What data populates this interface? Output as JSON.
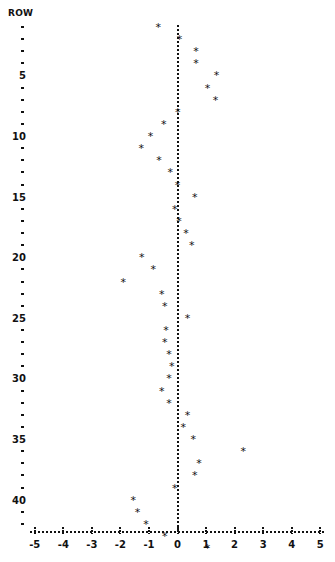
{
  "chart_data": {
    "type": "scatter",
    "title": "",
    "ylabel": "ROW",
    "xlabel": "",
    "xlim": [
      -5,
      5
    ],
    "ylim": [
      0,
      45
    ],
    "grid": false,
    "legend": null,
    "reference_line_x": 0,
    "x_ticks": [
      -5,
      -4,
      -3,
      -2,
      -1,
      0,
      1,
      2,
      3,
      4,
      5
    ],
    "x_tick_labels": [
      "-5",
      "-4",
      "-3",
      "-2",
      "-1",
      "0",
      "1",
      "2",
      "3",
      "4",
      "5"
    ],
    "y_ticks": [
      1,
      2,
      3,
      4,
      5,
      6,
      7,
      8,
      9,
      10,
      11,
      12,
      13,
      14,
      15,
      16,
      17,
      18,
      19,
      20,
      21,
      22,
      23,
      24,
      25,
      26,
      27,
      28,
      29,
      30,
      31,
      32,
      33,
      34,
      35,
      36,
      37,
      38,
      39,
      40,
      41,
      42
    ],
    "y_tick_labels": {
      "5": "5",
      "10": "10",
      "15": "15",
      "20": "20",
      "25": "25",
      "30": "30",
      "35": "35",
      "40": "40"
    },
    "marker": "*",
    "series": [
      {
        "name": "values",
        "rows": [
          1,
          2,
          3,
          4,
          5,
          6,
          7,
          8,
          9,
          10,
          11,
          12,
          13,
          14,
          15,
          16,
          17,
          18,
          19,
          20,
          21,
          22,
          23,
          24,
          25,
          26,
          27,
          28,
          29,
          30,
          31,
          32,
          33,
          34,
          35,
          36,
          37,
          38,
          39,
          40,
          41,
          42,
          43,
          44
        ],
        "values": [
          -0.67,
          0.07,
          0.65,
          0.65,
          1.37,
          1.05,
          1.33,
          0.01,
          -0.48,
          -0.95,
          -1.27,
          -0.65,
          -0.25,
          0.0,
          0.6,
          -0.1,
          0.05,
          0.3,
          0.5,
          -1.25,
          -0.85,
          -1.9,
          -0.55,
          -0.45,
          0.35,
          -0.4,
          -0.45,
          -0.3,
          -0.2,
          -0.3,
          -0.55,
          -0.3,
          0.35,
          0.2,
          0.55,
          2.3,
          0.75,
          0.6,
          -0.1,
          -1.55,
          -1.4,
          -1.1,
          -0.45,
          1.05
        ]
      }
    ]
  }
}
